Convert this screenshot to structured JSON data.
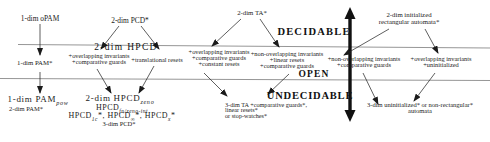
{
  "figure": {
    "regions": {
      "decidable": "DECIDABLE",
      "open": "OPEN",
      "undecidable": "UNDECIDABLE"
    },
    "top": {
      "opam": "1-dim oPAM",
      "pcd2": "2-dim PCD*",
      "ta2": "2-dim TA*",
      "init_rect": [
        "2-dim initialized",
        "rectangular automata*"
      ]
    },
    "band": {
      "pam1": "1-dim PAM*",
      "hpcd2": "2-dim HPCD",
      "g1": [
        "+overlapping invariants",
        "+comparative guards"
      ],
      "g2": "+translational resets",
      "g3": [
        "+overlapping invariants",
        "+comparative guards",
        "+constant resets"
      ],
      "g4": [
        "+non-overlapping invariants",
        "+linear resets",
        "+comparative guards"
      ],
      "g5": [
        "+non-overlapping invariants",
        "+comparative guards"
      ],
      "g6": [
        "+overlapping invariants",
        "+uninitialized"
      ]
    },
    "bottom": {
      "pam_pow": {
        "base": "1-dim PAM",
        "sub": "pow"
      },
      "pam2": "2-dim PAM*",
      "hpcd_zeno": {
        "base": "2-dim HPCD",
        "sub": "zeno"
      },
      "hpcd_fn": {
        "base": "HPCD",
        "sub": "fn/zeno-int"
      },
      "hpcd_row": [
        {
          "base": "HPCD",
          "sub": "1c",
          "post": "*, "
        },
        {
          "base": "HPCD",
          "sub": "∞",
          "post": "*, "
        },
        {
          "base": "HPCD",
          "sub": "x",
          "post": "*"
        }
      ],
      "pcd3": "3-dim PCD*",
      "ta3": [
        "3-dim TA +comparative guards*,",
        "linear resets*",
        "or stop-watches*"
      ],
      "uninit3": [
        "3-dim uninitialized* or non-rectangular*",
        "automata"
      ]
    },
    "ink_color": "#1b1b1b",
    "rule_color": "#8a8a8a"
  }
}
